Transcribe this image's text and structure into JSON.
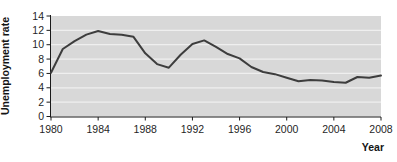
{
  "figure": {
    "kind": "line-chart-figure",
    "y_axis_title": "Unemployment rate",
    "x_axis_title": "Year"
  },
  "chart_data": {
    "type": "line",
    "title": "",
    "xlabel": "Year",
    "ylabel": "Unemployment rate",
    "x": [
      1980,
      1981,
      1982,
      1983,
      1984,
      1985,
      1986,
      1987,
      1988,
      1989,
      1990,
      1991,
      1992,
      1993,
      1994,
      1995,
      1996,
      1997,
      1998,
      1999,
      2000,
      2001,
      2002,
      2003,
      2004,
      2005,
      2006,
      2007,
      2008
    ],
    "values": [
      6.1,
      9.4,
      10.5,
      11.4,
      11.9,
      11.5,
      11.4,
      11.1,
      8.8,
      7.3,
      6.8,
      8.6,
      10.1,
      10.6,
      9.7,
      8.7,
      8.1,
      6.9,
      6.2,
      5.9,
      5.4,
      4.9,
      5.1,
      5.0,
      4.8,
      4.7,
      5.5,
      5.4,
      5.7
    ],
    "xlim": [
      1980,
      2008
    ],
    "ylim": [
      0,
      14
    ],
    "x_ticks": [
      1980,
      1984,
      1988,
      1992,
      1996,
      2000,
      2004,
      2008
    ],
    "y_ticks": [
      0,
      2,
      4,
      6,
      8,
      10,
      12,
      14
    ],
    "grid": "horizontal light lines every 2 units on grey panel",
    "legend": "none",
    "colors": {
      "plot_background": "#d8d8d8",
      "series_line": "#3d3d3d",
      "gridline": "#efefef",
      "axis": "#1a1a1a",
      "text": "#1f1f1f"
    }
  }
}
